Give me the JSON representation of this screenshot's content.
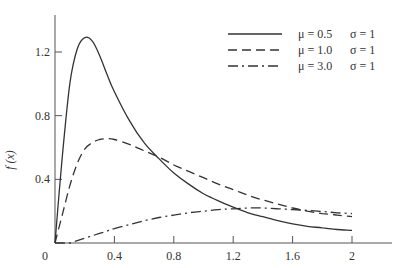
{
  "chart_data": {
    "type": "line",
    "title": "",
    "xlabel": "",
    "ylabel": "f(x)",
    "xlim": [
      0,
      2.2
    ],
    "ylim": [
      0,
      1.45
    ],
    "xticks": [
      0.4,
      0.8,
      1.2,
      1.6,
      2
    ],
    "xtick_labels": [
      "0.4",
      "0.8",
      "1.2",
      "1.6",
      "2"
    ],
    "origin_label": "0",
    "yticks": [
      0.4,
      0.8,
      1.2
    ],
    "ytick_labels": [
      "0.4",
      "0.8",
      "1.2"
    ],
    "grid": false,
    "legend_position": "upper right",
    "x": [
      0,
      0.05,
      0.1,
      0.15,
      0.2,
      0.25,
      0.3,
      0.35,
      0.4,
      0.5,
      0.6,
      0.7,
      0.8,
      0.9,
      1.0,
      1.1,
      1.2,
      1.3,
      1.4,
      1.5,
      1.6,
      1.7,
      1.8,
      1.9,
      2.0
    ],
    "series": [
      {
        "name": "μ = 0.5   σ = 1",
        "mu": "0.5",
        "sigma": "1",
        "line_style": "solid",
        "values": [
          0,
          0.55,
          1.0,
          1.22,
          1.29,
          1.27,
          1.18,
          1.06,
          0.95,
          0.77,
          0.63,
          0.53,
          0.44,
          0.37,
          0.31,
          0.265,
          0.225,
          0.19,
          0.165,
          0.14,
          0.12,
          0.105,
          0.095,
          0.085,
          0.08
        ]
      },
      {
        "name": "μ = 1.0   σ = 1",
        "mu": "1.0",
        "sigma": "1",
        "line_style": "dashed",
        "values": [
          0,
          0.18,
          0.36,
          0.5,
          0.59,
          0.63,
          0.65,
          0.655,
          0.65,
          0.62,
          0.58,
          0.54,
          0.49,
          0.45,
          0.41,
          0.37,
          0.335,
          0.3,
          0.27,
          0.245,
          0.22,
          0.2,
          0.185,
          0.175,
          0.165
        ]
      },
      {
        "name": "μ = 3.0   σ = 1",
        "mu": "3.0",
        "sigma": "1",
        "line_style": "dashdot",
        "values": [
          0,
          0,
          0,
          0.015,
          0.03,
          0.045,
          0.06,
          0.075,
          0.09,
          0.115,
          0.14,
          0.16,
          0.175,
          0.19,
          0.2,
          0.21,
          0.215,
          0.22,
          0.22,
          0.215,
          0.21,
          0.205,
          0.198,
          0.19,
          0.185
        ]
      }
    ]
  },
  "legend": {
    "items": [
      {
        "mu_label": "μ = 0.5",
        "sigma_label": "σ = 1"
      },
      {
        "mu_label": "μ = 1.0",
        "sigma_label": "σ = 1"
      },
      {
        "mu_label": "μ = 3.0",
        "sigma_label": "σ = 1"
      }
    ]
  },
  "axes": {
    "ylabel": "f (x)",
    "origin_label": "0"
  }
}
